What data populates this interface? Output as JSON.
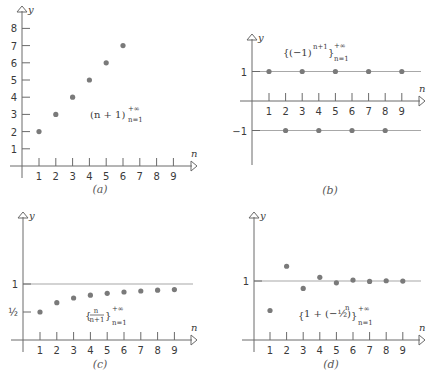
{
  "chart_data": [
    {
      "panel": "a",
      "type": "scatter",
      "title": "(n + 1)_{n=1}^{+∞}",
      "formula": {
        "main": "(n + 1)",
        "sup": "+∞",
        "sub": "n=1"
      },
      "caption": "(a)",
      "xlabel": "n",
      "ylabel": "y",
      "x_ticks": [
        1,
        2,
        3,
        4,
        5,
        6,
        7,
        8,
        9
      ],
      "y_ticks": [
        1,
        2,
        3,
        4,
        5,
        6,
        7,
        8
      ],
      "x": [
        1,
        2,
        3,
        4,
        5,
        6
      ],
      "values": [
        2,
        3,
        4,
        5,
        6,
        7
      ],
      "xlim": [
        0,
        10
      ],
      "ylim": [
        0,
        9
      ],
      "grid": false
    },
    {
      "panel": "b",
      "type": "scatter",
      "title": "{(−1)^{n+1}}_{n=1}^{+∞}",
      "formula": {
        "main": "(−1)",
        "exp": "n+1",
        "sup": "+∞",
        "sub": "n=1"
      },
      "caption": "(b)",
      "xlabel": "n",
      "ylabel": "y",
      "x_ticks": [
        1,
        2,
        3,
        4,
        5,
        6,
        7,
        8,
        9
      ],
      "y_ticks": [
        {
          "value": 1,
          "label": "1"
        },
        {
          "value": -1,
          "label": "−1"
        }
      ],
      "reference_lines": [
        1,
        -1
      ],
      "x": [
        1,
        2,
        3,
        4,
        5,
        6,
        7,
        8,
        9
      ],
      "values": [
        1,
        -1,
        1,
        -1,
        1,
        -1,
        1,
        -1,
        1
      ],
      "ylim": [
        -2,
        2
      ],
      "grid": false
    },
    {
      "panel": "c",
      "type": "scatter",
      "title": "{n/(n+1)}_{n=1}^{+∞}",
      "formula": {
        "num": "n",
        "den": "n+1",
        "sup": "+∞",
        "sub": "n=1"
      },
      "caption": "(c)",
      "xlabel": "n",
      "ylabel": "y",
      "x_ticks": [
        1,
        2,
        3,
        4,
        5,
        6,
        7,
        8,
        9
      ],
      "y_ticks": [
        {
          "value": 1,
          "label": "1"
        },
        {
          "value": 0.5,
          "label": "½"
        }
      ],
      "reference_lines": [
        1
      ],
      "x": [
        1,
        2,
        3,
        4,
        5,
        6,
        7,
        8,
        9
      ],
      "values": [
        0.5,
        0.667,
        0.75,
        0.8,
        0.833,
        0.857,
        0.875,
        0.889,
        0.9
      ],
      "ylim": [
        0,
        2
      ],
      "grid": false
    },
    {
      "panel": "d",
      "type": "scatter",
      "title": "{1 + (−½)^n}_{n=1}^{+∞}",
      "formula": {
        "main": "1 + (−½)",
        "exp": "n",
        "sup": "+∞",
        "sub": "n=1"
      },
      "caption": "(d)",
      "xlabel": "n",
      "ylabel": "y",
      "x_ticks": [
        1,
        2,
        3,
        4,
        5,
        6,
        7,
        8,
        9
      ],
      "y_ticks": [
        {
          "value": 1,
          "label": "1"
        }
      ],
      "reference_lines": [
        1
      ],
      "x": [
        1,
        2,
        3,
        4,
        5,
        6,
        7,
        8,
        9
      ],
      "values": [
        0.5,
        1.25,
        0.875,
        1.0625,
        0.96875,
        1.015625,
        0.9921875,
        1.00390625,
        0.998046875
      ],
      "ylim": [
        0,
        2
      ],
      "grid": false
    }
  ]
}
